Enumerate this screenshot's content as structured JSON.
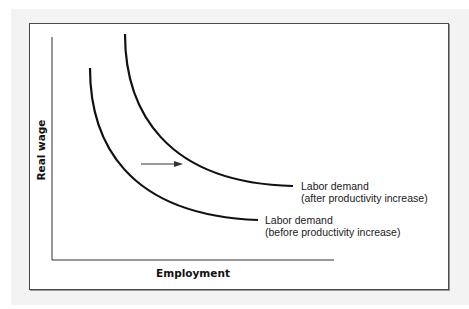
{
  "figure": {
    "y_axis_label": "Real wage",
    "x_axis_label": "Employment",
    "curves": [
      {
        "id": "after",
        "label_line1": "Labor demand",
        "label_line2": "(after productivity increase)"
      },
      {
        "id": "before",
        "label_line1": "Labor demand",
        "label_line2": "(before productivity increase)"
      }
    ],
    "shift_arrow": "right",
    "colors": {
      "line": "#111111",
      "axis": "#333333",
      "arrow": "#333333",
      "frame_bg": "#f3f3f3",
      "panel_bg": "#ffffff"
    }
  }
}
